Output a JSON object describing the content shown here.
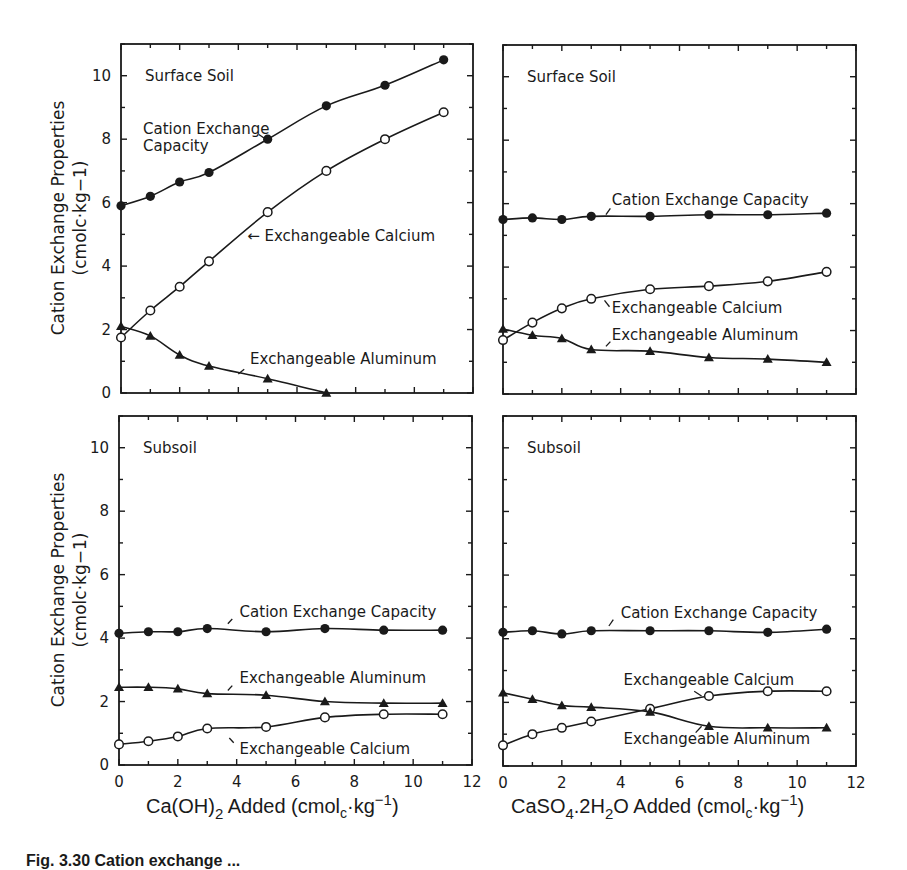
{
  "figure": {
    "caption_visible": "Fig. 3.30   Cation exchange ...",
    "y_axis_title_line1": "Cation Exchange Properties",
    "y_axis_title_line2": "(cmolc·kg−1)",
    "x_axis_titles": {
      "left": {
        "pre": "Ca(OH)",
        "sub": "2",
        "mid": " Added (cmol",
        "sub2": "c",
        "post": "·kg",
        "sup": "−1",
        "end": ")"
      },
      "right": {
        "pre": "CaSO",
        "sub": "4",
        "mid0": ".2H",
        "sub0": "2",
        "mid": "O Added (cmol",
        "sub2": "c",
        "post": "·kg",
        "sup": "−1",
        "end": ")"
      }
    },
    "colors": {
      "ink": "#1a1a1a",
      "background": "#ffffff"
    }
  },
  "chart_data": [
    {
      "type": "line",
      "panel": "top-left",
      "title": "Surface Soil",
      "xlabel": "Ca(OH)2 Added (cmolc·kg−1)",
      "ylabel": "Cation Exchange Properties (cmolc·kg−1)",
      "xlim": [
        0,
        12
      ],
      "ylim": [
        0,
        11
      ],
      "xticks": [
        0,
        2,
        4,
        6,
        8,
        10,
        12
      ],
      "yticks": [
        0,
        2,
        4,
        6,
        8,
        10
      ],
      "grid": false,
      "series": [
        {
          "name": "Cation Exchange Capacity",
          "marker": "filled-circle",
          "x": [
            0,
            1,
            2,
            3,
            5,
            7,
            9,
            11
          ],
          "values": [
            5.9,
            6.2,
            6.65,
            6.95,
            8.0,
            9.05,
            9.7,
            10.5
          ],
          "label_lines": [
            "Cation Exchange",
            "Capacity"
          ],
          "label_at": [
            0.75,
            8.15
          ],
          "leader": [
            [
              4.7,
              8.15
            ],
            [
              4.9,
              8.02
            ]
          ]
        },
        {
          "name": "Exchangeable Calcium",
          "marker": "open-circle",
          "x": [
            0,
            1,
            2,
            3,
            5,
            7,
            9,
            11
          ],
          "values": [
            1.75,
            2.6,
            3.35,
            4.15,
            5.7,
            7.0,
            8.0,
            8.85
          ],
          "label_lines": [
            "← Exchangeable Calcium"
          ],
          "label_at": [
            4.3,
            4.8
          ],
          "leader": null
        },
        {
          "name": "Exchangeable Aluminum",
          "marker": "filled-triangle",
          "x": [
            0,
            1,
            2,
            3,
            5,
            7
          ],
          "values": [
            2.1,
            1.8,
            1.2,
            0.85,
            0.45,
            0.0
          ],
          "label_lines": [
            "Exchangeable Aluminum"
          ],
          "label_at": [
            4.4,
            0.9
          ],
          "leader": [
            [
              4.0,
              0.6
            ],
            [
              4.2,
              0.75
            ]
          ]
        }
      ]
    },
    {
      "type": "line",
      "panel": "top-right",
      "title": "Surface Soil",
      "xlabel": "CaSO4.2H2O Added (cmolc·kg−1)",
      "xlim": [
        0,
        12
      ],
      "ylim": [
        0,
        11
      ],
      "xticks": [
        0,
        2,
        4,
        6,
        8,
        10,
        12
      ],
      "yticks": [
        0,
        2,
        4,
        6,
        8,
        10
      ],
      "grid": false,
      "series": [
        {
          "name": "Cation Exchange Capacity",
          "marker": "filled-circle",
          "x": [
            0,
            1,
            2,
            3,
            5,
            7,
            9,
            11
          ],
          "values": [
            5.5,
            5.55,
            5.5,
            5.6,
            5.6,
            5.65,
            5.65,
            5.7
          ],
          "label_lines": [
            "Cation Exchange Capacity"
          ],
          "label_at": [
            3.7,
            5.95
          ],
          "leader": [
            [
              3.5,
              5.65
            ],
            [
              3.65,
              5.85
            ]
          ]
        },
        {
          "name": "Exchangeable Calcium",
          "marker": "open-circle",
          "x": [
            0,
            1,
            2,
            3,
            5,
            7,
            9,
            11
          ],
          "values": [
            1.7,
            2.25,
            2.7,
            3.0,
            3.3,
            3.4,
            3.55,
            3.85
          ],
          "label_lines": [
            "Exchangeable Calcium"
          ],
          "label_at": [
            3.7,
            2.55
          ],
          "leader": [
            [
              3.45,
              2.95
            ],
            [
              3.62,
              2.75
            ]
          ]
        },
        {
          "name": "Exchangeable Aluminum",
          "marker": "filled-triangle",
          "x": [
            0,
            1,
            2,
            3,
            5,
            7,
            9,
            11
          ],
          "values": [
            2.05,
            1.85,
            1.75,
            1.4,
            1.35,
            1.15,
            1.1,
            1.0
          ],
          "label_lines": [
            "Exchangeable Aluminum"
          ],
          "label_at": [
            3.7,
            1.7
          ],
          "leader": [
            [
              3.5,
              1.5
            ],
            [
              3.65,
              1.65
            ]
          ]
        }
      ]
    },
    {
      "type": "line",
      "panel": "bottom-left",
      "title": "Subsoil",
      "xlabel": "Ca(OH)2 Added (cmolc·kg−1)",
      "ylabel": "Cation Exchange Properties (cmolc·kg−1)",
      "xlim": [
        0,
        12
      ],
      "ylim": [
        0,
        11
      ],
      "xticks": [
        0,
        2,
        4,
        6,
        8,
        10,
        12
      ],
      "yticks": [
        0,
        2,
        4,
        6,
        8,
        10
      ],
      "grid": false,
      "series": [
        {
          "name": "Cation Exchange Capacity",
          "marker": "filled-circle",
          "x": [
            0,
            1,
            2,
            3,
            5,
            7,
            9,
            11
          ],
          "values": [
            4.15,
            4.2,
            4.2,
            4.3,
            4.2,
            4.3,
            4.25,
            4.25
          ],
          "label_lines": [
            "Cation Exchange Capacity"
          ],
          "label_at": [
            4.1,
            4.65
          ],
          "leader": [
            [
              3.7,
              4.45
            ],
            [
              3.85,
              4.6
            ]
          ]
        },
        {
          "name": "Exchangeable Aluminum",
          "marker": "filled-triangle",
          "x": [
            0,
            1,
            2,
            3,
            5,
            7,
            9,
            11
          ],
          "values": [
            2.45,
            2.45,
            2.4,
            2.25,
            2.2,
            2.0,
            1.95,
            1.95
          ],
          "label_lines": [
            "Exchangeable Aluminum"
          ],
          "label_at": [
            4.1,
            2.6
          ],
          "leader": [
            [
              3.7,
              2.35
            ],
            [
              3.85,
              2.5
            ]
          ]
        },
        {
          "name": "Exchangeable Calcium",
          "marker": "open-circle",
          "x": [
            0,
            1,
            2,
            3,
            5,
            7,
            9,
            11
          ],
          "values": [
            0.65,
            0.75,
            0.9,
            1.15,
            1.2,
            1.5,
            1.6,
            1.6
          ],
          "label_lines": [
            "Exchangeable Calcium"
          ],
          "label_at": [
            4.1,
            0.35
          ],
          "leader": [
            [
              3.75,
              0.85
            ],
            [
              3.9,
              0.7
            ]
          ]
        }
      ]
    },
    {
      "type": "line",
      "panel": "bottom-right",
      "title": "Subsoil",
      "xlabel": "CaSO4.2H2O Added (cmolc·kg−1)",
      "xlim": [
        0,
        12
      ],
      "ylim": [
        0,
        11
      ],
      "xticks": [
        0,
        2,
        4,
        6,
        8,
        10,
        12
      ],
      "yticks": [
        0,
        2,
        4,
        6,
        8,
        10
      ],
      "grid": false,
      "series": [
        {
          "name": "Cation Exchange Capacity",
          "marker": "filled-circle",
          "x": [
            0,
            1,
            2,
            3,
            5,
            7,
            9,
            11
          ],
          "values": [
            4.2,
            4.25,
            4.15,
            4.25,
            4.25,
            4.25,
            4.2,
            4.3
          ],
          "label_lines": [
            "Cation Exchange Capacity"
          ],
          "label_at": [
            4.0,
            4.65
          ],
          "leader": [
            [
              3.6,
              4.4
            ],
            [
              3.75,
              4.6
            ]
          ]
        },
        {
          "name": "Exchangeable Calcium",
          "marker": "open-circle",
          "x": [
            0,
            1,
            2,
            3,
            5,
            7,
            9,
            11
          ],
          "values": [
            0.65,
            1.0,
            1.2,
            1.4,
            1.8,
            2.2,
            2.35,
            2.35
          ],
          "label_lines": [
            "Exchangeable Calcium"
          ],
          "label_at": [
            4.1,
            2.55
          ],
          "leader": [
            [
              6.5,
              2.35
            ],
            [
              6.75,
              2.2
            ]
          ]
        },
        {
          "name": "Exchangeable Aluminum",
          "marker": "filled-triangle",
          "x": [
            0,
            1,
            2,
            3,
            5,
            7,
            9,
            11
          ],
          "values": [
            2.3,
            2.1,
            1.9,
            1.85,
            1.7,
            1.25,
            1.2,
            1.2
          ],
          "label_lines": [
            "Exchangeable Aluminum"
          ],
          "label_at": [
            4.1,
            0.7
          ],
          "leader": [
            [
              6.55,
              1.05
            ],
            [
              6.75,
              1.25
            ]
          ]
        }
      ]
    }
  ],
  "layout": {
    "panels": [
      {
        "left": 121,
        "top": 44,
        "right": 473,
        "bottom": 393,
        "show_y_ticks_labels": true,
        "show_x_tick_labels": false
      },
      {
        "left": 503,
        "top": 45,
        "right": 856,
        "bottom": 394,
        "show_y_ticks_labels": false,
        "show_x_tick_labels": false
      },
      {
        "left": 119,
        "top": 416,
        "right": 472,
        "bottom": 765,
        "show_y_ticks_labels": true,
        "show_x_tick_labels": true
      },
      {
        "left": 503,
        "top": 416,
        "right": 856,
        "bottom": 766,
        "show_y_ticks_labels": false,
        "show_x_tick_labels": true
      }
    ]
  }
}
